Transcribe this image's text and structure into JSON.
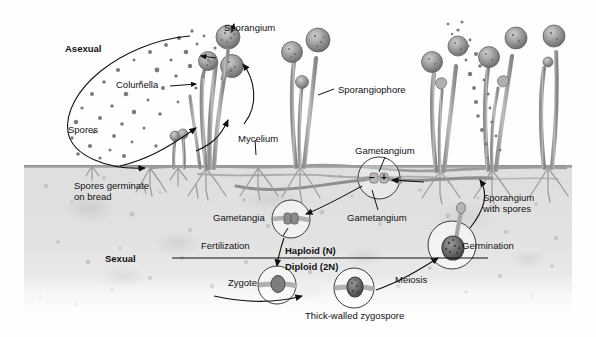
{
  "figure": {
    "background_color": "#fefefe",
    "substrate_color": "#e0e0e0",
    "ink_color": "#111111"
  },
  "cycle_headings": {
    "asexual": "Asexual",
    "sexual": "Sexual"
  },
  "ploidy_divider": {
    "haploid": "Haploid (N)",
    "haploid_main": "Haploid",
    "haploid_paren": "(N)",
    "diploid": "Diploid (2N)",
    "diploid_main": "Diploid",
    "diploid_paren": "(2N)"
  },
  "labels": {
    "sporangium": "Sporangium",
    "columella": "Columella",
    "spores": "Spores",
    "mycelium": "Mycelium",
    "sporangiophore": "Sporangiophore",
    "gametangium_top": "Gametangium",
    "spores_germinate_line1": "Spores germinate",
    "spores_germinate_line2": "on bread",
    "gametangia": "Gametangia",
    "gametangium_lower": "Gametangium",
    "fertilization": "Fertilization",
    "zygote": "Zygote",
    "meiosis": "Meiosis",
    "germination": "Germination",
    "thick_walled_zygospore": "Thick-walled zygospore",
    "sporangium_with_spores_line1": "Sporangium",
    "sporangium_with_spores_line2": "with spores"
  },
  "mating_types": {
    "minus": "–",
    "plus": "+"
  },
  "structures": {
    "sporangia_count": 9,
    "sporangiophore_clusters": 4,
    "circle_insets": [
      {
        "name": "gametangium-fusion",
        "label": "Gametangium"
      },
      {
        "name": "gametangia-pair",
        "label": "Gametangia"
      },
      {
        "name": "zygote",
        "label": "Zygote"
      },
      {
        "name": "thick-walled-zygospore",
        "label": "Thick-walled zygospore"
      },
      {
        "name": "germinating-zygospore",
        "label": "Germination"
      }
    ]
  }
}
